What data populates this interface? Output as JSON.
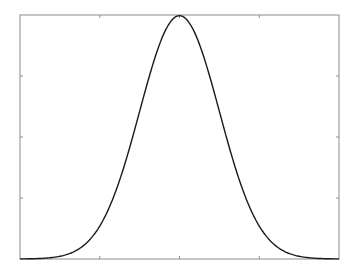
{
  "chart_data": {
    "type": "line",
    "title": "",
    "xlabel": "",
    "ylabel": "",
    "xlim": [
      -4,
      4
    ],
    "ylim": [
      0,
      0.4
    ],
    "x_ticks": [
      -2,
      0,
      2
    ],
    "y_ticks": [
      0.1,
      0.2,
      0.3
    ],
    "tick_labels_visible": false,
    "grid": false,
    "legend": null,
    "series": [
      {
        "name": "standard normal pdf",
        "function": "exp(-x^2/2)/sqrt(2*pi)",
        "x": [
          -4,
          -3.5,
          -3,
          -2.5,
          -2,
          -1.5,
          -1,
          -0.5,
          0,
          0.5,
          1,
          1.5,
          2,
          2.5,
          3,
          3.5,
          4
        ],
        "values": [
          0.0001,
          0.0009,
          0.0044,
          0.0175,
          0.054,
          0.1295,
          0.242,
          0.3521,
          0.3989,
          0.3521,
          0.242,
          0.1295,
          0.054,
          0.0175,
          0.0044,
          0.0009,
          0.0001
        ]
      }
    ],
    "colors": {
      "line": "#1a1a1a",
      "axes": "#8c8c8c",
      "background": "#ffffff"
    }
  }
}
